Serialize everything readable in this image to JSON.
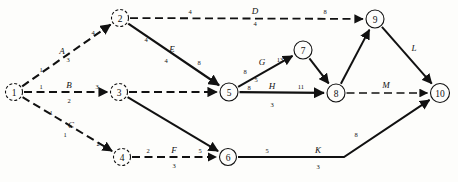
{
  "diagram": {
    "type": "activity-on-arrow network / CPM project graph",
    "width": 458,
    "height": 182,
    "background_color": "#fdfdfb",
    "ink_color": "#111111",
    "nodes": [
      {
        "id": "1",
        "label": "1",
        "x": 14,
        "y": 92,
        "r": 8.5,
        "dashed": true
      },
      {
        "id": "2",
        "label": "2",
        "x": 120,
        "y": 18,
        "r": 8.5,
        "dashed": true
      },
      {
        "id": "3",
        "label": "3",
        "x": 119,
        "y": 92,
        "r": 8.5,
        "dashed": true
      },
      {
        "id": "4",
        "label": "4",
        "x": 122,
        "y": 157,
        "r": 8.5,
        "dashed": true
      },
      {
        "id": "5",
        "label": "5",
        "x": 229,
        "y": 92,
        "r": 9.0,
        "dashed": false
      },
      {
        "id": "6",
        "label": "6",
        "x": 228,
        "y": 157,
        "r": 8.5,
        "dashed": false
      },
      {
        "id": "7",
        "label": "7",
        "x": 303,
        "y": 50,
        "r": 9.0,
        "dashed": false
      },
      {
        "id": "8",
        "label": "8",
        "x": 336,
        "y": 93,
        "r": 9.0,
        "dashed": false
      },
      {
        "id": "9",
        "label": "9",
        "x": 375,
        "y": 19,
        "r": 9.0,
        "dashed": false
      },
      {
        "id": "10",
        "label": "10",
        "x": 440,
        "y": 93,
        "r": 9.5,
        "dashed": false
      }
    ],
    "edges": [
      {
        "id": "A",
        "name": "A",
        "from": "1",
        "to": "2",
        "style": "dashed",
        "head_number": "1",
        "tail_number": "4",
        "below_number": "3",
        "name_pos": {
          "x": 62,
          "y": 51
        },
        "head_num_pos": {
          "x": 41,
          "y": 69
        },
        "tail_num_pos": {
          "x": 93,
          "y": 32
        },
        "below_num_pos": {
          "x": 68,
          "y": 59
        }
      },
      {
        "id": "B",
        "name": "B",
        "from": "1",
        "to": "3",
        "style": "dashed",
        "head_number": "1",
        "tail_number": "3",
        "below_number": "2",
        "name_pos": {
          "x": 69,
          "y": 85
        },
        "head_num_pos": {
          "x": 41,
          "y": 86
        },
        "tail_num_pos": {
          "x": 97,
          "y": 86
        },
        "below_num_pos": {
          "x": 69,
          "y": 100
        }
      },
      {
        "id": "C",
        "name": "C",
        "from": "1",
        "to": "4",
        "style": "dashed",
        "head_number": "1",
        "tail_number": "2",
        "below_number": "1",
        "name_pos": {
          "x": 71,
          "y": 125
        },
        "head_num_pos": {
          "x": 51,
          "y": 112
        },
        "tail_num_pos": {
          "x": 98,
          "y": 143
        },
        "below_num_pos": {
          "x": 65,
          "y": 134
        }
      },
      {
        "id": "D",
        "name": "D",
        "from": "2",
        "to": "9",
        "style": "dashed",
        "head_number": "4",
        "tail_number": "8",
        "below_number": "4",
        "name_pos": {
          "x": 255,
          "y": 11
        },
        "head_num_pos": {
          "x": 190,
          "y": 11
        },
        "tail_num_pos": {
          "x": 325,
          "y": 11
        },
        "below_num_pos": {
          "x": 255,
          "y": 23
        }
      },
      {
        "id": "E",
        "name": "E",
        "from": "2",
        "to": "5",
        "style": "solid",
        "head_number": "4",
        "tail_number": "8",
        "below_number": "4",
        "name_pos": {
          "x": 172,
          "y": 49
        },
        "head_num_pos": {
          "x": 146,
          "y": 39
        },
        "tail_num_pos": {
          "x": 199,
          "y": 62
        },
        "below_num_pos": {
          "x": 166,
          "y": 60
        }
      },
      {
        "id": "F",
        "name": "F",
        "from": "4",
        "to": "6",
        "style": "dashed",
        "head_number": "2",
        "tail_number": "5",
        "below_number": "3",
        "name_pos": {
          "x": 174,
          "y": 150
        },
        "head_num_pos": {
          "x": 148,
          "y": 150
        },
        "tail_num_pos": {
          "x": 200,
          "y": 150
        },
        "below_num_pos": {
          "x": 174,
          "y": 165
        }
      },
      {
        "id": "G",
        "name": "G",
        "from": "5",
        "to": "7",
        "style": "solid",
        "head_number": "8",
        "tail_number": "13",
        "below_number": "5",
        "name_pos": {
          "x": 262,
          "y": 62
        },
        "head_num_pos": {
          "x": 245,
          "y": 71
        },
        "tail_num_pos": {
          "x": 280,
          "y": 59
        },
        "below_num_pos": {
          "x": 256,
          "y": 79
        }
      },
      {
        "id": "H",
        "name": "H",
        "from": "5",
        "to": "8",
        "style": "solid",
        "head_number": "8",
        "tail_number": "11",
        "below_number": "3",
        "name_pos": {
          "x": 272,
          "y": 86
        },
        "head_num_pos": {
          "x": 249,
          "y": 87
        },
        "tail_num_pos": {
          "x": 301,
          "y": 86
        },
        "below_num_pos": {
          "x": 272,
          "y": 104
        }
      },
      {
        "id": "K",
        "name": "K",
        "from": "6",
        "to": "10",
        "style": "solid",
        "head_number": "5",
        "tail_number": "8",
        "below_number": "3",
        "name_pos": {
          "x": 318,
          "y": 150
        },
        "head_num_pos": {
          "x": 267,
          "y": 150
        },
        "tail_num_pos": {
          "x": 356,
          "y": 134
        },
        "below_num_pos": {
          "x": 318,
          "y": 166
        }
      },
      {
        "id": "L",
        "name": "L",
        "from": "9",
        "to": "10",
        "style": "solid",
        "head_number": "",
        "tail_number": "",
        "below_number": "",
        "name_pos": {
          "x": 414,
          "y": 48
        },
        "head_num_pos": {
          "x": 0,
          "y": 0
        },
        "tail_num_pos": {
          "x": 0,
          "y": 0
        },
        "below_num_pos": {
          "x": 0,
          "y": 0
        }
      },
      {
        "id": "M",
        "name": "M",
        "from": "8",
        "to": "10",
        "style": "dashed",
        "head_number": "",
        "tail_number": "",
        "below_number": "",
        "name_pos": {
          "x": 386,
          "y": 85
        },
        "head_num_pos": {
          "x": 0,
          "y": 0
        },
        "tail_num_pos": {
          "x": 0,
          "y": 0
        },
        "below_num_pos": {
          "x": 0,
          "y": 0
        }
      },
      {
        "id": "I",
        "name": "",
        "from": "7",
        "to": "8",
        "style": "solid",
        "head_number": "",
        "tail_number": "",
        "below_number": "",
        "name_pos": {
          "x": 0,
          "y": 0
        },
        "head_num_pos": {
          "x": 0,
          "y": 0
        },
        "tail_num_pos": {
          "x": 0,
          "y": 0
        },
        "below_num_pos": {
          "x": 0,
          "y": 0
        }
      },
      {
        "id": "J",
        "name": "",
        "from": "3",
        "to": "6",
        "style": "solid",
        "head_number": "",
        "tail_number": "",
        "below_number": "",
        "name_pos": {
          "x": 0,
          "y": 0
        },
        "head_num_pos": {
          "x": 0,
          "y": 0
        },
        "tail_num_pos": {
          "x": 0,
          "y": 0
        },
        "below_num_pos": {
          "x": 0,
          "y": 0
        }
      },
      {
        "id": "N",
        "name": "",
        "from": "3",
        "to": "5",
        "style": "dashed",
        "head_number": "",
        "tail_number": "",
        "below_number": "",
        "name_pos": {
          "x": 0,
          "y": 0
        },
        "head_num_pos": {
          "x": 0,
          "y": 0
        },
        "tail_num_pos": {
          "x": 0,
          "y": 0
        },
        "below_num_pos": {
          "x": 0,
          "y": 0
        }
      },
      {
        "id": "O",
        "name": "",
        "from": "8",
        "to": "9",
        "style": "solid",
        "head_number": "",
        "tail_number": "",
        "below_number": "",
        "name_pos": {
          "x": 0,
          "y": 0
        },
        "head_num_pos": {
          "x": 0,
          "y": 0
        },
        "tail_num_pos": {
          "x": 0,
          "y": 0
        },
        "below_num_pos": {
          "x": 0,
          "y": 0
        }
      }
    ]
  }
}
